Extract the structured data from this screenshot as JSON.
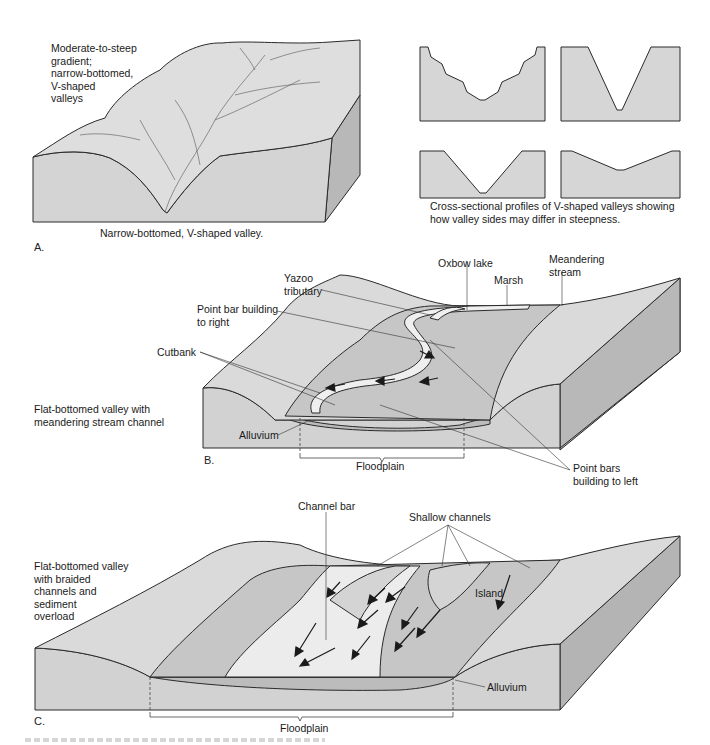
{
  "panel_a": {
    "letter": "A.",
    "description": "Moderate-to-steep\ngradient;\nnarrow-bottomed,\nV-shaped\nvalleys",
    "caption": "Narrow-bottomed, V-shaped valley.",
    "profiles_caption": "Cross-sectional profiles of V-shaped valleys showing\nhow valley sides may differ in steepness."
  },
  "panel_b": {
    "letter": "B.",
    "description": "Flat-bottomed valley with\nmeandering stream channel",
    "labels": {
      "yazoo": "Yazoo\ntributary",
      "point_bar_right": "Point bar building\nto right",
      "cutbank": "Cutbank",
      "alluvium": "Alluvium",
      "floodplain": "Floodplain",
      "oxbow": "Oxbow lake",
      "marsh": "Marsh",
      "meandering": "Meandering\nstream",
      "point_bars_left": "Point bars\nbuilding to left"
    }
  },
  "panel_c": {
    "letter": "C.",
    "description": "Flat-bottomed valley\nwith braided\nchannels and\nsediment\noverload",
    "labels": {
      "channel_bar": "Channel bar",
      "shallow_channels": "Shallow channels",
      "island": "Island",
      "alluvium": "Alluvium",
      "floodplain": "Floodplain"
    }
  },
  "colors": {
    "land_top": "#dcdcdc",
    "land_front": "#d2d2d2",
    "land_side": "#b4b4b4",
    "floodplain": "#c4c4c4",
    "water": "#ececec",
    "line": "#2a2a2a"
  }
}
